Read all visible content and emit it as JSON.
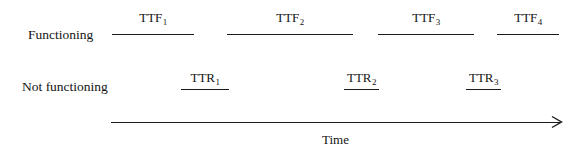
{
  "diagram": {
    "title_caption": "Time",
    "states": [
      {
        "id": "functioning",
        "label": "Functioning"
      },
      {
        "id": "not-functioning",
        "label": "Not functioning"
      }
    ],
    "uptime_segments": [
      {
        "id": "ttf-1",
        "base": "TTF",
        "index": "1",
        "x_start": 112,
        "x_end": 194
      },
      {
        "id": "ttf-2",
        "base": "TTF",
        "index": "2",
        "x_start": 227,
        "x_end": 353
      },
      {
        "id": "ttf-3",
        "base": "TTF",
        "index": "3",
        "x_start": 378,
        "x_end": 474
      },
      {
        "id": "ttf-4",
        "base": "TTF",
        "index": "4",
        "x_start": 497,
        "x_end": 559
      }
    ],
    "downtime_segments": [
      {
        "id": "ttr-1",
        "base": "TTR",
        "index": "1",
        "x_start": 181,
        "x_end": 229
      },
      {
        "id": "ttr-2",
        "base": "TTR",
        "index": "2",
        "x_start": 344,
        "x_end": 379
      },
      {
        "id": "ttr-3",
        "base": "TTR",
        "index": "3",
        "x_start": 466,
        "x_end": 501
      }
    ],
    "time_axis": {
      "x_start": 111,
      "x_end": 560,
      "y": 122
    },
    "colors": {
      "line": "#1a1a1a",
      "text": "#141414",
      "background": "#ffffff"
    }
  }
}
